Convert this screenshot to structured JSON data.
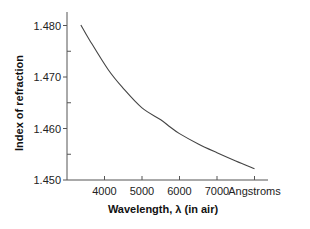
{
  "chart_data": {
    "type": "line",
    "title": "",
    "xlabel": "Wavelength, λ (in air)",
    "ylabel": "Index of refraction",
    "x_unit_label": "Angstroms",
    "xlim": [
      3000,
      8300
    ],
    "ylim": [
      1.45,
      1.481
    ],
    "x_ticks": [
      4000,
      5000,
      6000,
      7000,
      8000
    ],
    "x_tick_labels": [
      "4000",
      "5000",
      "6000",
      "7000",
      "Angstroms"
    ],
    "y_ticks": [
      1.45,
      1.46,
      1.47,
      1.48
    ],
    "y_tick_labels": [
      "1.450",
      "1.460",
      "1.470",
      "1.480"
    ],
    "y_minor_ticks": [
      1.455,
      1.465,
      1.475
    ],
    "grid": false,
    "legend": "none",
    "series": [
      {
        "name": "Index of refraction",
        "x": [
          3370,
          3600,
          4100,
          4500,
          5000,
          5500,
          5750,
          6000,
          6500,
          7000,
          7500,
          8000
        ],
        "y": [
          1.4801,
          1.4772,
          1.4714,
          1.4678,
          1.464,
          1.4617,
          1.4603,
          1.459,
          1.457,
          1.4553,
          1.4537,
          1.4522
        ]
      }
    ]
  }
}
